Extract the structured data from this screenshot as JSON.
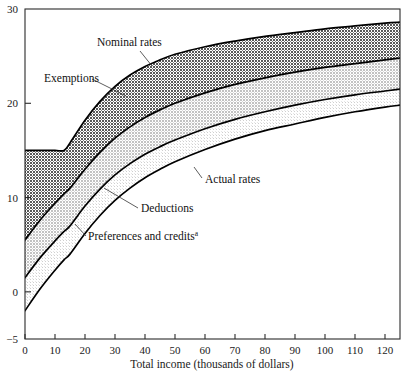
{
  "chart_data": {
    "type": "area",
    "title": "",
    "xlabel": "Total income (thousands of dollars)",
    "ylabel": "",
    "xlim": [
      0,
      125
    ],
    "ylim": [
      -5,
      30
    ],
    "grid": false,
    "legend_position": "inline-annotations",
    "x_ticks": [
      0,
      10,
      20,
      30,
      40,
      50,
      60,
      70,
      80,
      90,
      100,
      110,
      120
    ],
    "y_ticks": [
      -5,
      0,
      10,
      20,
      30
    ],
    "x": [
      0,
      5,
      10,
      13,
      15,
      20,
      25,
      30,
      35,
      40,
      45,
      50,
      60,
      70,
      80,
      90,
      100,
      110,
      120,
      125
    ],
    "series": [
      {
        "name": "Nominal rates",
        "role": "top-boundary",
        "values": [
          15.0,
          15.0,
          15.0,
          15.0,
          15.8,
          18.2,
          20.2,
          21.8,
          23.0,
          23.9,
          24.6,
          25.2,
          26.0,
          26.6,
          27.1,
          27.5,
          27.9,
          28.2,
          28.5,
          28.6
        ]
      },
      {
        "name": "Exemptions",
        "role": "band-lower-boundary",
        "values": [
          5.5,
          7.6,
          9.4,
          10.4,
          11.0,
          13.0,
          14.8,
          16.3,
          17.5,
          18.5,
          19.3,
          20.0,
          21.1,
          22.0,
          22.7,
          23.3,
          23.8,
          24.2,
          24.6,
          24.8
        ]
      },
      {
        "name": "Deductions",
        "role": "band-lower-boundary",
        "values": [
          1.5,
          3.6,
          5.4,
          6.4,
          7.0,
          9.1,
          10.9,
          12.4,
          13.6,
          14.6,
          15.4,
          16.1,
          17.3,
          18.3,
          19.1,
          19.8,
          20.4,
          20.9,
          21.3,
          21.5
        ]
      },
      {
        "name": "Preferences and credits",
        "role": "band-lower-boundary",
        "values": [
          -2.0,
          0.3,
          2.3,
          3.4,
          4.0,
          6.2,
          8.1,
          9.7,
          11.0,
          12.1,
          13.0,
          13.8,
          15.1,
          16.2,
          17.1,
          17.8,
          18.5,
          19.1,
          19.6,
          19.8
        ]
      }
    ],
    "annotations": [
      {
        "key": "nominal_rates",
        "text": "Nominal rates",
        "x_px": 97,
        "y_px": 46
      },
      {
        "key": "exemptions",
        "text": "Exemptions",
        "x_px": 44,
        "y_px": 82
      },
      {
        "key": "actual_rates",
        "text": "Actual rates",
        "x_px": 205,
        "y_px": 183
      },
      {
        "key": "deductions",
        "text": "Deductions",
        "x_px": 141,
        "y_px": 212
      },
      {
        "key": "preferences_credits",
        "text": "Preferences and credits",
        "x_px": 88,
        "y_px": 240,
        "superscript": "a"
      }
    ],
    "band_fills": {
      "exemptions": "#8e8e8e",
      "deductions": "#c9c9c9",
      "preferences": "#e4e4e4",
      "background": "#ffffff"
    }
  },
  "axes": {
    "x_tick_labels": [
      "0",
      "10",
      "20",
      "30",
      "40",
      "50",
      "60",
      "70",
      "80",
      "90",
      "100",
      "110",
      "120"
    ],
    "y_tick_labels": [
      "30",
      "20",
      "10",
      "0",
      "-5"
    ],
    "x_axis_title": "Total income (thousands of dollars)"
  }
}
